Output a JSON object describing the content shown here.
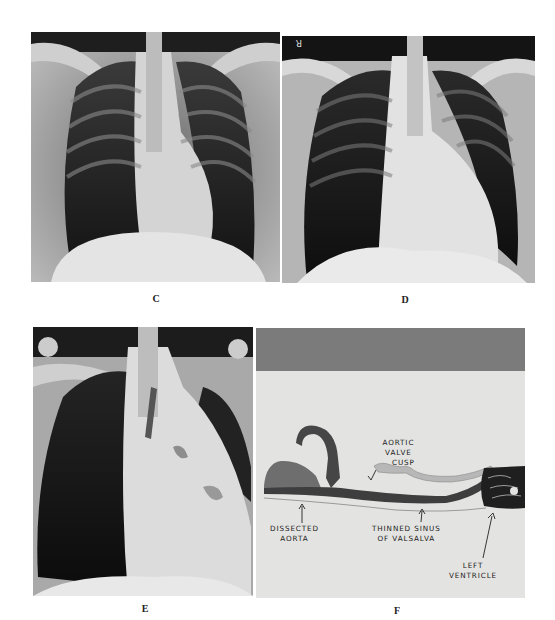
{
  "figure": {
    "panels": [
      {
        "id": "C",
        "label": "C",
        "type": "chest-radiograph",
        "description": "PA chest X-ray"
      },
      {
        "id": "D",
        "label": "D",
        "type": "chest-radiograph",
        "description": "PA chest X-ray with orientation marker"
      },
      {
        "id": "E",
        "label": "E",
        "type": "chest-radiograph",
        "description": "Chest X-ray with enlarged mediastinum"
      },
      {
        "id": "F",
        "label": "F",
        "type": "histology-section",
        "description": "Gross section of aortic root"
      }
    ],
    "panel_f_annotations": {
      "aortic_valve_cusp": [
        "AORTIC",
        "VALVE",
        "CUSP"
      ],
      "dissected_aorta": [
        "DISSECTED",
        "AORTA"
      ],
      "thinned_sinus": [
        "THINNED SINUS",
        "OF VALSALVA"
      ],
      "left_ventricle": [
        "LEFT",
        "VENTRICLE"
      ]
    },
    "marker_d": "R",
    "colors": {
      "page_background": "#ffffff",
      "panel_f_background": "#e3e3e1",
      "panel_f_band": "#7b7b7b",
      "tissue_dark": "#3c3c3c"
    }
  }
}
